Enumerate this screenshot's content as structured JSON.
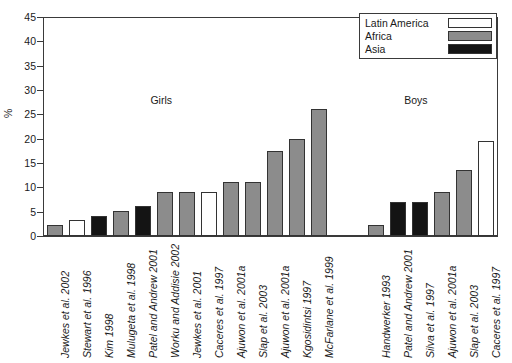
{
  "chart_data": {
    "type": "bar",
    "title": "",
    "xlabel": "",
    "ylabel": "%",
    "ylim": [
      0,
      45
    ],
    "ytick_step": 5,
    "yticks": [
      0,
      5,
      10,
      15,
      20,
      25,
      30,
      35,
      40,
      45
    ],
    "grid": false,
    "legend_position": "top-right",
    "legend": [
      {
        "label": "Latin America",
        "color": "#ffffff"
      },
      {
        "label": "Africa",
        "color": "#8c8c8c"
      },
      {
        "label": "Asia",
        "color": "#141414"
      }
    ],
    "group_annotations": [
      {
        "label": "Girls",
        "x_frac": 0.235,
        "y_value": 28
      },
      {
        "label": "Boys",
        "x_frac": 0.795,
        "y_value": 28
      }
    ],
    "categories": [
      "Jewkes et al. 2002",
      "Stewart et al. 1996",
      "Kim 1998",
      "Mulugeta et al. 1998",
      "Patel and Andrew 2001",
      "Worku and Addisie 2002",
      "Jewkes et al. 2001",
      "Caceres et al. 1997",
      "Ajuwon et al. 2001a",
      "Slap et al. 2003",
      "Ajuwon et al. 2001a",
      "Kgosidintsi 1997",
      "McFarlane et al. 1999",
      "Handwerker 1993",
      "Patel and Andrew 2001",
      "Silva et al. 1997",
      "Ajuwon et al. 2001a",
      "Slap et al. 2003",
      "Caceres et al. 1997"
    ],
    "values": [
      2.2,
      3.2,
      4.2,
      5.1,
      6.2,
      9.0,
      9.0,
      9.0,
      11.0,
      11.0,
      17.5,
      20.0,
      26.0,
      2.3,
      7.0,
      7.0,
      9.0,
      13.5,
      19.5
    ],
    "region": [
      "Africa",
      "Latin America",
      "Asia",
      "Africa",
      "Asia",
      "Africa",
      "Africa",
      "Latin America",
      "Africa",
      "Africa",
      "Africa",
      "Africa",
      "Africa",
      "Africa",
      "Asia",
      "Asia",
      "Africa",
      "Africa",
      "Latin America"
    ],
    "group": [
      "Girls",
      "Girls",
      "Girls",
      "Girls",
      "Girls",
      "Girls",
      "Girls",
      "Girls",
      "Girls",
      "Girls",
      "Girls",
      "Girls",
      "Girls",
      "Boys",
      "Boys",
      "Boys",
      "Boys",
      "Boys",
      "Boys"
    ],
    "gap_after_index": 12
  }
}
